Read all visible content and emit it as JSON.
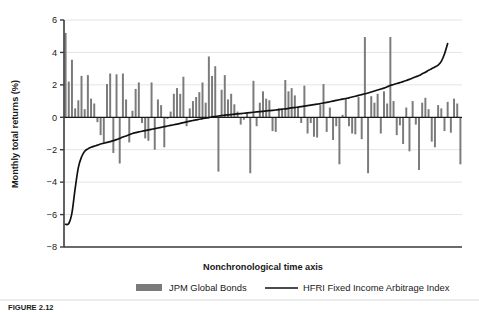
{
  "figure": {
    "caption": "FIGURE 2.12",
    "background": "#ffffff"
  },
  "chart_data": {
    "type": "bar",
    "title": "",
    "subtitle": "",
    "xlabel": "Nonchronological time axis",
    "ylabel": "Monthly total returns (%)",
    "ylim": [
      -8,
      6
    ],
    "xlim": [
      0,
      120
    ],
    "yticks": [
      6,
      4,
      2,
      0,
      -2,
      -4,
      -6,
      -8
    ],
    "ytick_labels": [
      "6",
      "4",
      "2",
      "0",
      "−2",
      "−4",
      "−6",
      "−8"
    ],
    "xticks": [],
    "xtick_labels": [],
    "grid": "horizontal",
    "grid_color": "#e4e4e4",
    "axis_color": "#3c3c3c",
    "zero_line": 0,
    "legend_position": "bottom",
    "legend": [
      {
        "name": "JPM Global Bonds",
        "type": "bar",
        "color": "#7b7b7b"
      },
      {
        "name": "HFRI Fixed Income Arbitrage Index",
        "type": "line",
        "color": "#111111"
      }
    ],
    "series": [
      {
        "name": "JPM Global Bonds",
        "type": "bar",
        "color": "#7b7b7b",
        "values": [
          5.2,
          2.2,
          3.55,
          0.55,
          1.05,
          2.55,
          0.5,
          2.6,
          1.15,
          0.85,
          -0.3,
          -1.1,
          -1.6,
          2.05,
          2.7,
          -2.2,
          2.65,
          -2.85,
          2.7,
          1.1,
          -1.55,
          0.4,
          1.75,
          2.15,
          -0.35,
          -1.3,
          -1.45,
          2.15,
          -2.0,
          1.1,
          0.75,
          -1.85,
          -0.1,
          0.35,
          1.45,
          1.8,
          1.45,
          2.5,
          -0.55,
          0.55,
          1.0,
          1.25,
          1.55,
          2.15,
          0.9,
          3.75,
          2.55,
          3.15,
          -3.35,
          1.7,
          2.6,
          1.1,
          1.45,
          0.8,
          0.35,
          -0.45,
          -0.15,
          0.25,
          -3.45,
          2.25,
          -0.55,
          0.9,
          1.6,
          1.15,
          1.05,
          -0.85,
          -0.9,
          0.55,
          0.45,
          2.3,
          1.6,
          1.8,
          1.35,
          0.6,
          -0.35,
          1.95,
          -1.0,
          -0.35,
          -1.2,
          -1.25,
          0.75,
          2.05,
          -0.9,
          0.6,
          -1.4,
          -0.55,
          -2.9,
          0.15,
          1.15,
          -0.55,
          -1.0,
          -1.05,
          1.25,
          -1.35,
          4.95,
          -3.45,
          1.3,
          0.9,
          1.45,
          -1.0,
          1.6,
          0.85,
          4.95,
          1.0,
          -1.1,
          -0.5,
          -1.65,
          0.6,
          -2.1,
          1.0,
          -0.45,
          -3.25,
          0.9,
          1.2,
          0.5,
          -1.5,
          -1.85,
          0.75,
          0.55,
          -0.85,
          0.95,
          -0.95,
          1.15,
          0.85,
          -2.9
        ]
      },
      {
        "name": "HFRI Fixed Income Arbitrage Index",
        "type": "line",
        "color": "#111111",
        "values": [
          -6.6,
          -6.55,
          -5.9,
          -4.4,
          -3.1,
          -2.45,
          -2.1,
          -1.95,
          -1.85,
          -1.78,
          -1.72,
          -1.65,
          -1.6,
          -1.55,
          -1.5,
          -1.44,
          -1.38,
          -1.3,
          -1.22,
          -1.15,
          -1.08,
          -1.0,
          -0.95,
          -0.9,
          -0.86,
          -0.82,
          -0.78,
          -0.74,
          -0.7,
          -0.66,
          -0.62,
          -0.58,
          -0.54,
          -0.5,
          -0.46,
          -0.42,
          -0.38,
          -0.33,
          -0.28,
          -0.24,
          -0.2,
          -0.16,
          -0.12,
          -0.08,
          -0.05,
          -0.02,
          0.02,
          0.05,
          0.08,
          0.11,
          0.13,
          0.15,
          0.17,
          0.19,
          0.21,
          0.23,
          0.25,
          0.27,
          0.29,
          0.31,
          0.33,
          0.35,
          0.37,
          0.39,
          0.41,
          0.43,
          0.45,
          0.47,
          0.5,
          0.52,
          0.55,
          0.58,
          0.6,
          0.63,
          0.66,
          0.69,
          0.72,
          0.75,
          0.78,
          0.81,
          0.84,
          0.88,
          0.92,
          0.96,
          1.0,
          1.04,
          1.08,
          1.12,
          1.16,
          1.2,
          1.25,
          1.3,
          1.35,
          1.4,
          1.45,
          1.5,
          1.56,
          1.62,
          1.68,
          1.74,
          1.8,
          1.88,
          1.96,
          2.02,
          2.08,
          2.14,
          2.2,
          2.27,
          2.34,
          2.42,
          2.5,
          2.58,
          2.68,
          2.78,
          2.9,
          3.0,
          3.1,
          3.22,
          3.45,
          3.9,
          4.55
        ]
      }
    ]
  },
  "plot_geometry": {
    "left": 64,
    "right": 462,
    "top": 20,
    "bottom": 247
  }
}
